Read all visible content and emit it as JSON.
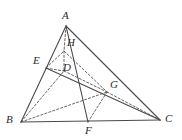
{
  "figure": {
    "kind": "geometry-diagram",
    "title": "",
    "width": 182,
    "height": 140,
    "background": "#ffffff",
    "stroke_solid": "#4a4a4a",
    "stroke_dashed": "#555555",
    "label_color": "#2b2b2b",
    "points": [
      {
        "name": "A",
        "label": "A",
        "x": 66,
        "y": 26,
        "lx": 62,
        "ly": 10
      },
      {
        "name": "B",
        "label": "B",
        "x": 21,
        "y": 122,
        "lx": 6,
        "ly": 114
      },
      {
        "name": "C",
        "label": "C",
        "x": 160,
        "y": 120,
        "lx": 165,
        "ly": 113
      },
      {
        "name": "E",
        "label": "E",
        "x": 46,
        "y": 68,
        "lx": 33,
        "ly": 55
      },
      {
        "name": "F",
        "label": "F",
        "x": 88,
        "y": 122,
        "lx": 85,
        "ly": 125
      },
      {
        "name": "G",
        "label": "G",
        "x": 107,
        "y": 92,
        "lx": 110,
        "ly": 79
      },
      {
        "name": "H",
        "label": "H",
        "x": 64,
        "y": 51,
        "lx": 67,
        "ly": 37
      },
      {
        "name": "D",
        "label": "D",
        "x": 64,
        "y": 71,
        "lx": 63,
        "ly": 62
      }
    ],
    "segments_solid": [
      {
        "name": "side-AB",
        "from": "A",
        "to": "B"
      },
      {
        "name": "side-AC",
        "from": "A",
        "to": "C"
      },
      {
        "name": "side-BC",
        "from": "B",
        "to": "C"
      },
      {
        "name": "cevian-EC",
        "from": "E",
        "to": "C"
      },
      {
        "name": "cevian-AF",
        "from": "A",
        "to": "F"
      }
    ],
    "segments_dashed": [
      {
        "name": "AH",
        "from": "A",
        "to": "H"
      },
      {
        "name": "HD",
        "from": "H",
        "to": "D"
      },
      {
        "name": "EH",
        "from": "E",
        "to": "H"
      },
      {
        "name": "ED",
        "from": "E",
        "to": "D"
      },
      {
        "name": "HG",
        "from": "H",
        "to": "G"
      },
      {
        "name": "DG",
        "from": "D",
        "to": "G"
      },
      {
        "name": "BD",
        "from": "B",
        "to": "D"
      },
      {
        "name": "BG",
        "from": "B",
        "to": "G"
      },
      {
        "name": "FG",
        "from": "F",
        "to": "G"
      },
      {
        "name": "GC",
        "from": "G",
        "to": "C"
      }
    ]
  }
}
